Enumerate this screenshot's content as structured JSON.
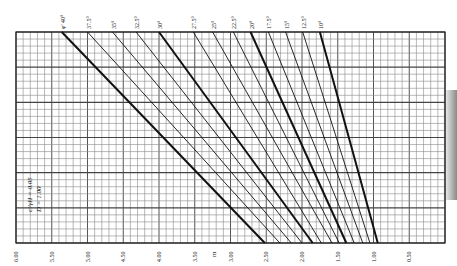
{
  "chart_data": {
    "type": "line",
    "title": "",
    "xlabel": "m",
    "ylabel": "",
    "x_ticks": [
      "6.00",
      "5.50",
      "5.00",
      "4.50",
      "4.00",
      "3.50",
      "3.00",
      "2.50",
      "2.00",
      "1.50",
      "1.00",
      "0.50"
    ],
    "xlim": [
      6.0,
      0.0
    ],
    "grid": true,
    "annotation": {
      "c_over_gammaH": "c'/γH = 0.05",
      "D": "D = 1.00"
    },
    "series_label_prefix": "φ' =",
    "series": [
      {
        "name": "40°",
        "bold": true,
        "x_top": 5.36,
        "x_bottom": 2.52
      },
      {
        "name": "37.5°",
        "bold": false,
        "x_top": 5.0,
        "x_bottom": 2.31
      },
      {
        "name": "35°",
        "bold": false,
        "x_top": 4.65,
        "x_bottom": 2.15
      },
      {
        "name": "32.5°",
        "bold": false,
        "x_top": 4.32,
        "x_bottom": 2.0
      },
      {
        "name": "30°",
        "bold": true,
        "x_top": 4.0,
        "x_bottom": 1.85
      },
      {
        "name": "27.5°",
        "bold": false,
        "x_top": 3.52,
        "x_bottom": 1.73
      },
      {
        "name": "25°",
        "bold": false,
        "x_top": 3.25,
        "x_bottom": 1.58
      },
      {
        "name": "22.5°",
        "bold": false,
        "x_top": 2.96,
        "x_bottom": 1.48
      },
      {
        "name": "20°",
        "bold": true,
        "x_top": 2.72,
        "x_bottom": 1.38
      },
      {
        "name": "17.5°",
        "bold": false,
        "x_top": 2.47,
        "x_bottom": 1.27
      },
      {
        "name": "15°",
        "bold": false,
        "x_top": 2.23,
        "x_bottom": 1.15
      },
      {
        "name": "12.5°",
        "bold": false,
        "x_top": 1.99,
        "x_bottom": 1.05
      },
      {
        "name": "10°",
        "bold": true,
        "x_top": 1.75,
        "x_bottom": 0.94
      }
    ]
  }
}
